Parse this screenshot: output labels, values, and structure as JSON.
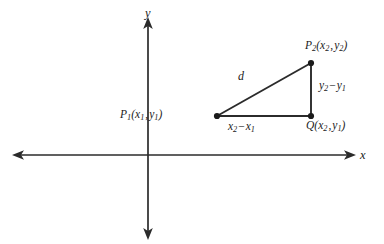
{
  "figure": {
    "background_color": "#ffffff",
    "stroke_color": "#2b2b2b",
    "text_color": "#1b1b1b"
  },
  "axes": {
    "x_label": "x",
    "y_label": "y",
    "origin": {
      "x": 148,
      "y": 155
    },
    "x_axis": {
      "start_x": 13,
      "end_x": 355,
      "y": 155,
      "arrow_left": true,
      "arrow_right": true
    },
    "y_axis": {
      "x": 148,
      "start_y": 18,
      "end_y": 238,
      "arrow_up": true,
      "arrow_down": true
    }
  },
  "triangle": {
    "vertices": {
      "p1": {
        "x": 217,
        "y": 116,
        "label_point": "P",
        "label_sub": "1",
        "coord_x": "x",
        "coord_x_sub": "1",
        "coord_y": "y",
        "coord_y_sub": "1"
      },
      "p2": {
        "x": 311,
        "y": 63,
        "label_point": "P",
        "label_sub": "2",
        "coord_x": "x",
        "coord_x_sub": "2",
        "coord_y": "y",
        "coord_y_sub": "2"
      },
      "q": {
        "x": 311,
        "y": 116,
        "label_point": "Q",
        "label_sub": "",
        "coord_x": "x",
        "coord_x_sub": "2",
        "coord_y": "y",
        "coord_y_sub": "1"
      }
    },
    "hypotenuse_label": "d",
    "vertical_leg": {
      "term1": "y",
      "term1_sub": "2",
      "operator": "−",
      "term2": "y",
      "term2_sub": "1"
    },
    "horizontal_leg": {
      "term1": "x",
      "term1_sub": "2",
      "operator": "−",
      "term2": "x",
      "term2_sub": "1"
    }
  },
  "labels": {
    "p1_point": "P",
    "p1_sub": "1",
    "p1_open": "(",
    "p1_x": "x",
    "p1_x_sub": "1",
    "p1_comma": ",",
    "p1_y": "y",
    "p1_y_sub": "1",
    "p1_close": ")",
    "p2_point": "P",
    "p2_sub": "2",
    "p2_open": "(",
    "p2_x": "x",
    "p2_x_sub": "2",
    "p2_comma": ",",
    "p2_y": "y",
    "p2_y_sub": "2",
    "p2_close": ")",
    "q_point": "Q",
    "q_open": "(",
    "q_x": "x",
    "q_x_sub": "2",
    "q_comma": ",",
    "q_y": "y",
    "q_y_sub": "1",
    "q_close": ")",
    "d": "d",
    "dy_term1": "y",
    "dy_sub1": "2",
    "dy_op": "−",
    "dy_term2": "y",
    "dy_sub2": "1",
    "dx_term1": "x",
    "dx_sub1": "2",
    "dx_op": "−",
    "dx_term2": "x",
    "dx_sub2": "1",
    "axis_x": "x",
    "axis_y": "y"
  }
}
